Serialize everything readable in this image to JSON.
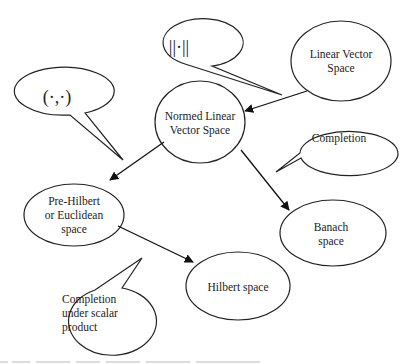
{
  "diagram": {
    "nodes": [
      {
        "id": "linear",
        "label_line1": "Linear Vector",
        "label_line2": "Space"
      },
      {
        "id": "normed",
        "label_line1": "Normed Linear",
        "label_line2": "Vector Space"
      },
      {
        "id": "prehilbert",
        "label_line1": "Pre-Hilbert",
        "label_line2": "or Euclidean",
        "label_line3": "space"
      },
      {
        "id": "banach",
        "label_line1": "Banach",
        "label_line2": "space"
      },
      {
        "id": "hilbert",
        "label_line1": "Hilbert space"
      }
    ],
    "callouts": [
      {
        "id": "norm",
        "label": "||·||"
      },
      {
        "id": "inner",
        "label": "(·,·)"
      },
      {
        "id": "completion",
        "label": "Completion"
      },
      {
        "id": "completion-scalar",
        "label_line1": "Completion",
        "label_line2": "under scalar",
        "label_line3": "product"
      }
    ],
    "edges": [
      {
        "from": "linear",
        "to": "normed"
      },
      {
        "from": "normed",
        "to": "prehilbert"
      },
      {
        "from": "normed",
        "to": "banach"
      },
      {
        "from": "prehilbert",
        "to": "hilbert"
      }
    ]
  }
}
